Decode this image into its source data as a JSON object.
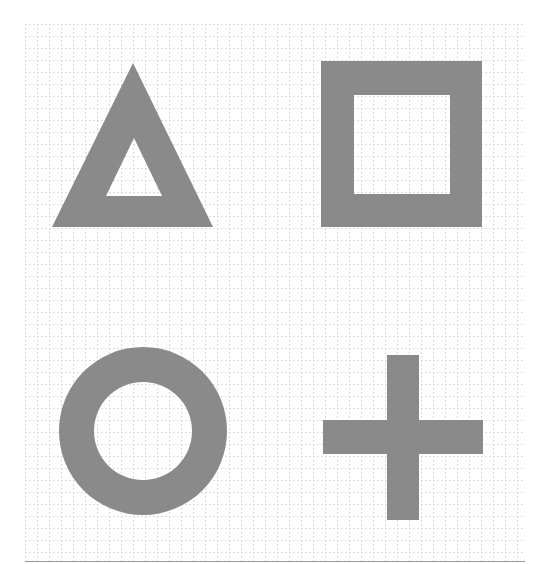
{
  "page": {
    "width": 549,
    "height": 564,
    "background": "#ffffff"
  },
  "grid": {
    "x": 25,
    "y": 24,
    "width": 500,
    "height": 537,
    "spacing": 12,
    "line_color": "#dcdcdc",
    "bottom_border_color": "#9a9a9a"
  },
  "shape_color": "#8a8a8a",
  "shapes": [
    {
      "name": "triangle",
      "type": "triangle-outline",
      "outer": [
        [
          133,
          63
        ],
        [
          213,
          227
        ],
        [
          52,
          227
        ]
      ],
      "inner": [
        [
          134,
          138
        ],
        [
          162,
          196
        ],
        [
          106,
          196
        ]
      ]
    },
    {
      "name": "square",
      "type": "square-outline",
      "outer": {
        "x": 321,
        "y": 61,
        "w": 161,
        "h": 166
      },
      "inner": {
        "x": 354,
        "y": 95,
        "w": 96,
        "h": 99
      }
    },
    {
      "name": "circle",
      "type": "ring",
      "cx": 143,
      "cy": 431,
      "outer_r": 84,
      "inner_r": 49
    },
    {
      "name": "cross",
      "type": "cross",
      "vertical": {
        "x": 387,
        "y": 355,
        "w": 32,
        "h": 165
      },
      "horizontal": {
        "x": 323,
        "y": 420,
        "w": 160,
        "h": 34
      }
    }
  ]
}
